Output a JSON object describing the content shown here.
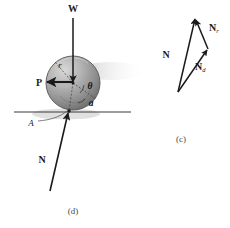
{
  "figure": {
    "subfigures": [
      {
        "id": "c",
        "label": "(c)",
        "caption_x": 181,
        "caption_y": 140
      },
      {
        "id": "d",
        "label": "(d)",
        "caption_x": 73,
        "caption_y": 214
      }
    ]
  },
  "panel_d": {
    "name": "sphere-free-body-diagram",
    "sphere": {
      "center_x": 73,
      "center_y": 83,
      "radius": 27,
      "fill_light": "#cfcfcf",
      "fill_mid": "#9a9a9a",
      "fill_dark": "#6f6f6f",
      "edge_color": "#4a4a4a"
    },
    "ground_line": {
      "x1": 14,
      "x2": 131,
      "y": 112,
      "color": "#3a3a3a"
    },
    "contact_point": {
      "x": 69,
      "y": 111
    },
    "vectors": [
      {
        "name": "weight-vector",
        "label": "W",
        "x1": 73,
        "y1": 18,
        "x2": 73,
        "y2": 82,
        "label_x": 73,
        "label_y": 12
      },
      {
        "name": "applied-force-vector",
        "label": "P",
        "x1": 73,
        "y1": 82,
        "x2": 46,
        "y2": 82,
        "label_x": 39,
        "label_y": 85
      },
      {
        "name": "normal-force-vector",
        "label": "N",
        "x1": 50,
        "y1": 191,
        "x2": 68,
        "y2": 112,
        "label_x": 42,
        "label_y": 160
      }
    ],
    "annotations": [
      {
        "name": "radius-label",
        "label": "r",
        "x": 60,
        "y": 67
      },
      {
        "name": "contact-point-label",
        "label": "A",
        "x": 32,
        "y": 124
      },
      {
        "name": "theta-angle-label",
        "label": "θ",
        "x": 90,
        "y": 88
      },
      {
        "name": "alpha-angle-label",
        "label": "a",
        "x": 90,
        "y": 105
      }
    ]
  },
  "panel_c": {
    "name": "normal-force-vector-triangle",
    "vertices": {
      "base": {
        "x": 178,
        "y": 92
      },
      "apex": {
        "x": 196,
        "y": 17
      },
      "right": {
        "x": 208,
        "y": 49
      }
    },
    "vectors": [
      {
        "name": "resultant-normal-vector",
        "label": "N",
        "subscript": "",
        "x1": 178,
        "y1": 92,
        "x2": 196,
        "y2": 17,
        "label_x": 166,
        "label_y": 56
      },
      {
        "name": "normal-r-component-vector",
        "label": "N",
        "subscript": "r",
        "x1": 208,
        "y1": 49,
        "x2": 196,
        "y2": 17,
        "label_x": 210,
        "label_y": 30
      },
      {
        "name": "normal-d-component-vector",
        "label": "N",
        "subscript": "d",
        "x1": 178,
        "y1": 92,
        "x2": 208,
        "y2": 49,
        "label_x": 196,
        "label_y": 68
      }
    ]
  },
  "colors": {
    "ink": "#1a1a1a",
    "line": "#3a3a3a",
    "caption": "#4a4a4a",
    "background": "#ffffff"
  }
}
